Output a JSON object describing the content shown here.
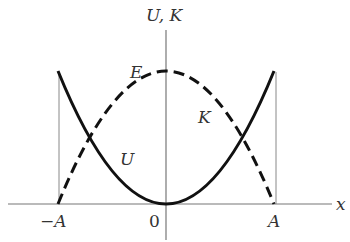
{
  "diagram": {
    "axes": {
      "y_label": "U, K",
      "x_label": "x",
      "x_ticks": [
        "−A",
        "0",
        "A"
      ]
    },
    "curves": {
      "potential": {
        "label": "U",
        "style": "solid",
        "shape": "parabola opening upward, zero at x=0, equals E at x=±A"
      },
      "kinetic": {
        "label": "K",
        "style": "dashed",
        "shape": "parabola opening downward, equals E at x=0, zero at x=±A"
      },
      "total": {
        "label": "E",
        "note": "max value of K at x=0"
      }
    },
    "colors": {
      "curve": "#111111",
      "axis": "#777777",
      "text": "#333333"
    }
  }
}
